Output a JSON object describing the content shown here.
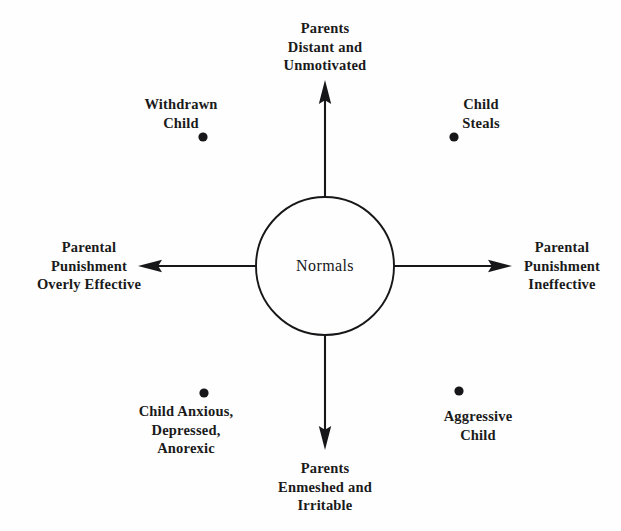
{
  "figure": {
    "background_color": "#fefefe",
    "ink_color": "#17171a"
  },
  "center": {
    "label": "Normals",
    "cx": 325,
    "cy": 266,
    "radius": 69
  },
  "axes": [
    {
      "id": "axis-top",
      "direction": "up",
      "lines": [
        "Parents",
        "Distant and",
        "Unmotivated"
      ],
      "label_x": 325,
      "label_y": 47,
      "arrow_from": [
        325,
        197
      ],
      "arrow_to": [
        325,
        82
      ]
    },
    {
      "id": "axis-right",
      "direction": "right",
      "lines": [
        "Parental",
        "Punishment",
        "Ineffective"
      ],
      "label_x": 562,
      "label_y": 266,
      "arrow_from": [
        394,
        266
      ],
      "arrow_to": [
        511,
        266
      ]
    },
    {
      "id": "axis-bottom",
      "direction": "down",
      "lines": [
        "Parents",
        "Enmeshed and",
        "Irritable"
      ],
      "label_x": 325,
      "label_y": 487,
      "arrow_from": [
        325,
        335
      ],
      "arrow_to": [
        325,
        449
      ]
    },
    {
      "id": "axis-left",
      "direction": "left",
      "lines": [
        "Parental",
        "Punishment",
        "Overly Effective"
      ],
      "label_x": 89,
      "label_y": 266,
      "arrow_from": [
        256,
        266
      ],
      "arrow_to": [
        139,
        266
      ]
    }
  ],
  "quadrant_points": [
    {
      "id": "withdrawn-child",
      "quadrant": "upper-left",
      "lines": [
        "Withdrawn",
        "Child"
      ],
      "label_x": 181,
      "label_y": 113,
      "dot_x": 203,
      "dot_y": 137,
      "dot_radius": 4.6
    },
    {
      "id": "child-steals",
      "quadrant": "upper-right",
      "lines": [
        "Child",
        "Steals"
      ],
      "label_x": 481,
      "label_y": 113,
      "dot_x": 454,
      "dot_y": 137,
      "dot_radius": 4.6
    },
    {
      "id": "child-anxious-depressed-anorexic",
      "quadrant": "lower-left",
      "lines": [
        "Child Anxious,",
        "Depressed,",
        "Anorexic"
      ],
      "label_x": 186,
      "label_y": 430,
      "dot_x": 204,
      "dot_y": 393,
      "dot_radius": 4.6
    },
    {
      "id": "aggressive-child",
      "quadrant": "lower-right",
      "lines": [
        "Aggressive",
        "Child"
      ],
      "label_x": 478,
      "label_y": 425,
      "dot_x": 459,
      "dot_y": 391,
      "dot_radius": 4.6
    }
  ]
}
